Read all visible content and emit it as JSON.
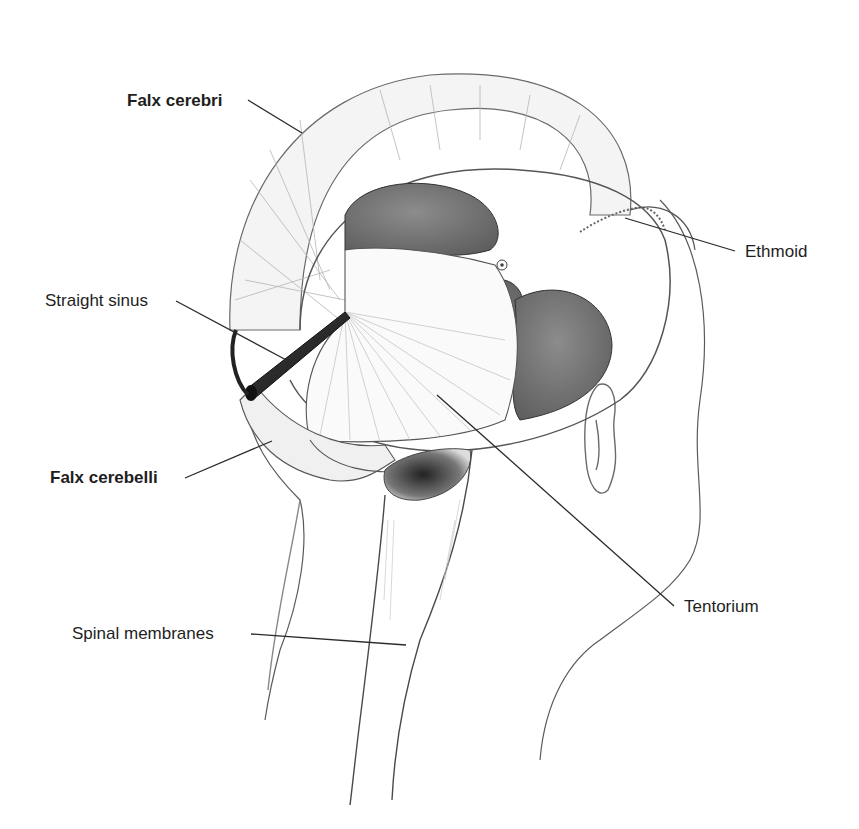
{
  "figure": {
    "colors": {
      "background": "#ffffff",
      "ink": "#1e1e1e",
      "dark_fill": "#6a6a6a",
      "mid_fill": "#8a8a8a",
      "light_stroke": "#9a9a9a"
    },
    "labels": [
      {
        "id": "falx-cerebri",
        "text": "Falx cerebri",
        "bold": true,
        "x": 127,
        "y": 91,
        "line": [
          [
            248,
            100
          ],
          [
            302,
            133
          ]
        ]
      },
      {
        "id": "straight-sinus",
        "text": "Straight sinus",
        "bold": false,
        "x": 45,
        "y": 291,
        "line": [
          [
            176,
            301
          ],
          [
            290,
            362
          ]
        ]
      },
      {
        "id": "falx-cerebelli",
        "text": "Falx cerebelli",
        "bold": true,
        "x": 50,
        "y": 468,
        "line": [
          [
            185,
            478
          ],
          [
            272,
            441
          ]
        ]
      },
      {
        "id": "spinal-membranes",
        "text": "Spinal membranes",
        "bold": false,
        "x": 72,
        "y": 624,
        "line": [
          [
            251,
            634
          ],
          [
            406,
            645
          ]
        ]
      },
      {
        "id": "ethmoid",
        "text": "Ethmoid",
        "bold": false,
        "x": 745,
        "y": 242,
        "line": [
          [
            735,
            251
          ],
          [
            625,
            218
          ]
        ]
      },
      {
        "id": "tentorium",
        "text": "Tentorium",
        "bold": false,
        "x": 684,
        "y": 597,
        "line": [
          [
            674,
            606
          ],
          [
            437,
            395
          ]
        ]
      }
    ]
  }
}
